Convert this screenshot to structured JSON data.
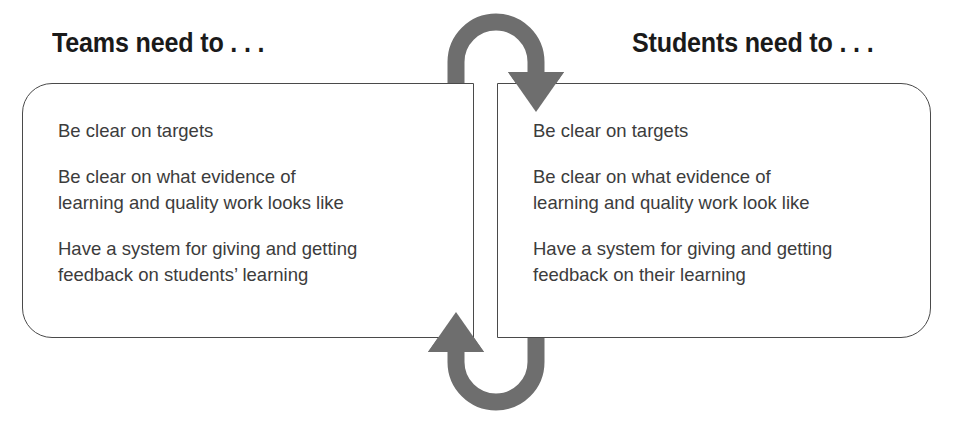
{
  "diagram": {
    "title_left": "Teams need to . . .",
    "title_right": "Students need to . . .",
    "colors": {
      "arrow_gray": "#6e6e6e",
      "box_border": "#4a4a4a",
      "heading_text": "#1a1a1a",
      "body_text": "#3c3c3c",
      "background": "#ffffff"
    },
    "left_panel": {
      "heading": "Teams need to . . .",
      "items": [
        "Be clear on targets",
        "Be clear on what evidence of\nlearning and quality work looks like",
        "Have a system for giving and getting\nfeedback on students’ learning"
      ]
    },
    "right_panel": {
      "heading": "Students need to . . .",
      "items": [
        "Be clear on targets",
        "Be clear on what evidence of\nlearning and quality work look like",
        "Have a system for giving and getting\nfeedback on their learning"
      ]
    },
    "arrows": [
      {
        "name": "top-arrow-left-to-right",
        "direction": "left-to-right-over-top",
        "shape": "u-turn-arch",
        "head": "down"
      },
      {
        "name": "bottom-arrow-right-to-left",
        "direction": "right-to-left-under-bottom",
        "shape": "u-turn-arch",
        "head": "up"
      }
    ]
  }
}
